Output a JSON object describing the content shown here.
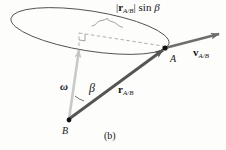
{
  "figure": {
    "caption": "(b)",
    "background_color": "#fdfdfc",
    "labels": {
      "length_expression": {
        "bar_open": "|",
        "vector": "r",
        "subscript": "A/B",
        "bar_close": "|",
        "function": "sin",
        "angle": "β"
      },
      "velocity": {
        "vector": "v",
        "subscript": "A/B"
      },
      "position": {
        "vector": "r",
        "subscript": "A/B"
      },
      "angular_velocity": "ω",
      "angle": "β",
      "point_a": "A",
      "point_b": "B"
    },
    "colors": {
      "velocity_arrow": "#6e6e6e",
      "position_arrow": "#555555",
      "omega_arrow": "#c9c9c9",
      "ellipse_stroke": "#4a4a4a",
      "dashed_stroke": "#999999",
      "brace_stroke": "#8a8a8a",
      "point_marker": "#111111",
      "text": "#151515"
    },
    "geometry": {
      "point_a": [
        165,
        48
      ],
      "point_b": [
        69,
        120
      ],
      "velocity_tip": [
        219,
        34
      ],
      "omega_tip": [
        79,
        46
      ],
      "ellipse_center": [
        90,
        31
      ],
      "ellipse_rx": 80,
      "ellipse_ry": 20,
      "ellipse_rotation_deg": 9
    }
  }
}
